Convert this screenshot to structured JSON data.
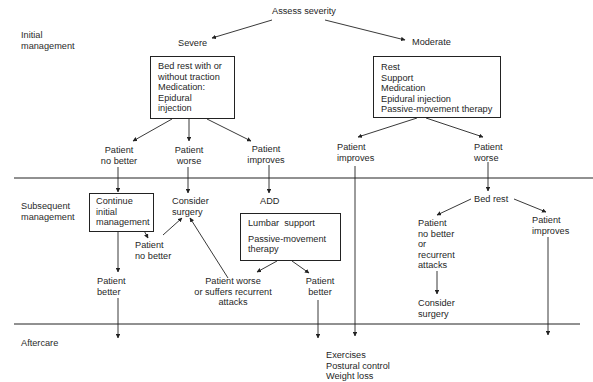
{
  "sections": {
    "initial": "Initial\nmanagement",
    "subsequent": "Subsequent\nmanagement",
    "aftercare": "Aftercare"
  },
  "nodes": {
    "assess": "Assess severity",
    "severe": "Severe",
    "moderate": "Moderate",
    "severe_box": "Bed rest with or\nwithout traction\nMedication:\nEpidural\ninjection",
    "moderate_box": "Rest\nSupport\nMedication\nEpidural injection\nPassive-movement therapy",
    "sev_no_better": "Patient\nno better",
    "sev_worse": "Patient\nworse",
    "sev_improves": "Patient\nimproves",
    "mod_improves": "Patient\nimproves",
    "mod_worse": "Patient\nworse",
    "continue_box": "Continue\ninitial\nmanagement",
    "consider_surgery_1": "Consider\nsurgery",
    "add": "ADD",
    "add_box_1": "Lumbar  support",
    "add_box_2": "Passive-movement\ntherapy",
    "cont_no_better": "Patient\nno better",
    "cont_better": "Patient\nbetter",
    "add_worse": "Patient worse\nor suffers recurrent\nattacks",
    "add_better": "Patient\nbetter",
    "bed_rest": "Bed rest",
    "bed_no_better": "Patient\nno better\nor\nrecurrent\nattacks",
    "bed_improves": "Patient\nimproves",
    "consider_surgery_2": "Consider\nsurgery",
    "aftercare_list": "Exercises\nPostural control\nWeight loss"
  },
  "colors": {
    "line": "#222222",
    "text": "#1f1f1f",
    "background": "#ffffff"
  }
}
